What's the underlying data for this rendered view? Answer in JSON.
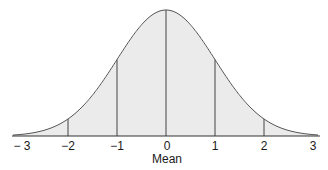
{
  "diagram": {
    "x_axis_label": "Mean",
    "tick_labels": [
      "− 3",
      "−2",
      "−1",
      "0",
      "1",
      "2",
      "3"
    ],
    "tick_values": [
      -3,
      -2,
      -1,
      0,
      1,
      2,
      3
    ],
    "vertical_lines_at": [
      -2,
      -1,
      0,
      1,
      2
    ],
    "colors": {
      "fill": "#ebebeb",
      "curve": "#555555",
      "lines": "#444444",
      "axis": "#333333",
      "text": "#1a1a1a"
    }
  },
  "chart_data": {
    "type": "area",
    "title": "",
    "xlabel": "Mean",
    "ylabel": "",
    "x": [
      -3,
      -2,
      -1,
      0,
      1,
      2,
      3
    ],
    "tick_labels": [
      "− 3",
      "−2",
      "−1",
      "0",
      "1",
      "2",
      "3"
    ],
    "series": [
      {
        "name": "normal density",
        "distribution": "standard normal",
        "values": [
          0.0044,
          0.054,
          0.242,
          0.399,
          0.242,
          0.054,
          0.0044
        ]
      }
    ],
    "xlim": [
      -3.1,
      3.1
    ],
    "grid": false,
    "legend": "none"
  }
}
